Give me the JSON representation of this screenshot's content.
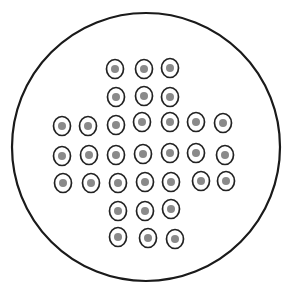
{
  "colors": {
    "background": "#ffffff",
    "board_outline": "#1a1a1a",
    "hole_outline": "#222222",
    "peg_fill": "#8a8a8a"
  },
  "board": {
    "shape": "circle",
    "cx": 146,
    "cy": 147,
    "rx": 134,
    "ry": 134
  },
  "hole_count": 33,
  "holes": [
    {
      "row": 1,
      "x": 115,
      "y": 69,
      "peg": true
    },
    {
      "row": 1,
      "x": 144,
      "y": 69,
      "peg": true
    },
    {
      "row": 1,
      "x": 170,
      "y": 68,
      "peg": true
    },
    {
      "row": 2,
      "x": 116,
      "y": 97,
      "peg": true
    },
    {
      "row": 2,
      "x": 144,
      "y": 96,
      "peg": true
    },
    {
      "row": 2,
      "x": 170,
      "y": 97,
      "peg": true
    },
    {
      "row": 3,
      "x": 62,
      "y": 126,
      "peg": true
    },
    {
      "row": 3,
      "x": 88,
      "y": 126,
      "peg": true
    },
    {
      "row": 3,
      "x": 116,
      "y": 125,
      "peg": true
    },
    {
      "row": 3,
      "x": 142,
      "y": 122,
      "peg": true
    },
    {
      "row": 3,
      "x": 170,
      "y": 122,
      "peg": true
    },
    {
      "row": 3,
      "x": 196,
      "y": 122,
      "peg": true
    },
    {
      "row": 3,
      "x": 223,
      "y": 123,
      "peg": true
    },
    {
      "row": 4,
      "x": 62,
      "y": 156,
      "peg": true
    },
    {
      "row": 4,
      "x": 89,
      "y": 155,
      "peg": true
    },
    {
      "row": 4,
      "x": 116,
      "y": 155,
      "peg": true
    },
    {
      "row": 4,
      "x": 143,
      "y": 154,
      "peg": true
    },
    {
      "row": 4,
      "x": 170,
      "y": 153,
      "peg": true
    },
    {
      "row": 4,
      "x": 196,
      "y": 153,
      "peg": true
    },
    {
      "row": 4,
      "x": 225,
      "y": 155,
      "peg": true
    },
    {
      "row": 5,
      "x": 63,
      "y": 183,
      "peg": true
    },
    {
      "row": 5,
      "x": 91,
      "y": 183,
      "peg": true
    },
    {
      "row": 5,
      "x": 118,
      "y": 183,
      "peg": true
    },
    {
      "row": 5,
      "x": 145,
      "y": 182,
      "peg": true
    },
    {
      "row": 5,
      "x": 171,
      "y": 182,
      "peg": true
    },
    {
      "row": 5,
      "x": 201,
      "y": 181,
      "peg": true
    },
    {
      "row": 5,
      "x": 226,
      "y": 181,
      "peg": true
    },
    {
      "row": 6,
      "x": 118,
      "y": 211,
      "peg": true
    },
    {
      "row": 6,
      "x": 145,
      "y": 211,
      "peg": true
    },
    {
      "row": 6,
      "x": 171,
      "y": 209,
      "peg": true
    },
    {
      "row": 7,
      "x": 118,
      "y": 237,
      "peg": true
    },
    {
      "row": 7,
      "x": 148,
      "y": 238,
      "peg": true
    },
    {
      "row": 7,
      "x": 175,
      "y": 239,
      "peg": true
    }
  ]
}
